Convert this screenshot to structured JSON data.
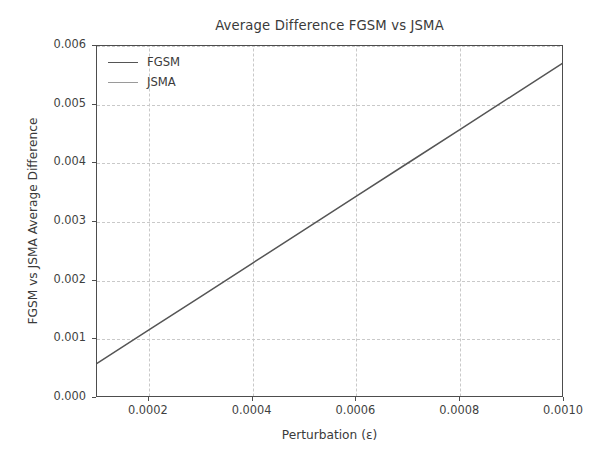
{
  "chart_data": {
    "type": "line",
    "title": "Average Difference FGSM vs JSMA",
    "xlabel": "Perturbation (ε)",
    "ylabel": "FGSM vs JSMA Average Difference",
    "x": [
      0.0001,
      0.0002,
      0.0003,
      0.0004,
      0.0005,
      0.0006,
      0.0007,
      0.0008,
      0.0009,
      0.001
    ],
    "xlim": [
      0.0001,
      0.001
    ],
    "ylim": [
      0.0,
      0.006
    ],
    "grid": true,
    "legend_position": "upper left",
    "xticks": [
      0.0002,
      0.0004,
      0.0006,
      0.0008,
      0.001
    ],
    "xtick_labels": [
      "0.0002",
      "0.0004",
      "0.0006",
      "0.0008",
      "0.0010"
    ],
    "yticks": [
      0.0,
      0.001,
      0.002,
      0.003,
      0.004,
      0.005,
      0.006
    ],
    "ytick_labels": [
      "0.000",
      "0.001",
      "0.002",
      "0.003",
      "0.004",
      "0.005",
      "0.006"
    ],
    "series": [
      {
        "name": "FGSM",
        "color": "#555555",
        "values": [
          0.00059,
          0.00116,
          0.00173,
          0.0023,
          0.00287,
          0.00344,
          0.00401,
          0.00458,
          0.00515,
          0.00572
        ]
      },
      {
        "name": "JSMA",
        "color": "#9a9a9a",
        "values": [
          0.0,
          0.0,
          0.0,
          0.0,
          0.0,
          0.0,
          0.0,
          0.0,
          0.0,
          0.0
        ]
      }
    ]
  },
  "legend": {
    "items": [
      {
        "label": "FGSM",
        "color": "#555555"
      },
      {
        "label": "JSMA",
        "color": "#9a9a9a"
      }
    ]
  },
  "axes": {
    "spine_color": "#4d4d4d",
    "grid_color": "#c9c9c9",
    "background": "#ffffff"
  }
}
